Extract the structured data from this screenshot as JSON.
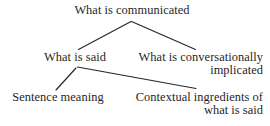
{
  "diagram": {
    "type": "tree",
    "title": "What is communicated",
    "background_color": "#ffffff",
    "text_color": "#1f1f1f",
    "edge_color": "#262626",
    "nodes": {
      "root": {
        "id": "what-is-communicated",
        "lines": [
          "What is communicated"
        ],
        "align": "center"
      },
      "what_is_said": {
        "id": "what-is-said",
        "lines": [
          "What is said"
        ],
        "align": "center"
      },
      "conversationally_implicated": {
        "id": "what-is-conversationally-implicated",
        "lines": [
          "What is conversationally",
          "implicated"
        ],
        "align": "right"
      },
      "sentence_meaning": {
        "id": "sentence-meaning",
        "lines": [
          "Sentence meaning"
        ],
        "align": "center"
      },
      "contextual_ingredients": {
        "id": "contextual-ingredients-of-what-is-said",
        "lines": [
          "Contextual ingredients of",
          "what is said"
        ],
        "align": "right"
      }
    },
    "edges": [
      {
        "id": "root-to-what-is-said",
        "from": "what-is-communicated",
        "to": "what-is-said"
      },
      {
        "id": "root-to-conversationally-implicated",
        "from": "what-is-communicated",
        "to": "what-is-conversationally-implicated"
      },
      {
        "id": "what-is-said-to-sentence-meaning",
        "from": "what-is-said",
        "to": "sentence-meaning"
      },
      {
        "id": "what-is-said-to-contextual-ingredients",
        "from": "what-is-said",
        "to": "contextual-ingredients-of-what-is-said"
      }
    ]
  }
}
